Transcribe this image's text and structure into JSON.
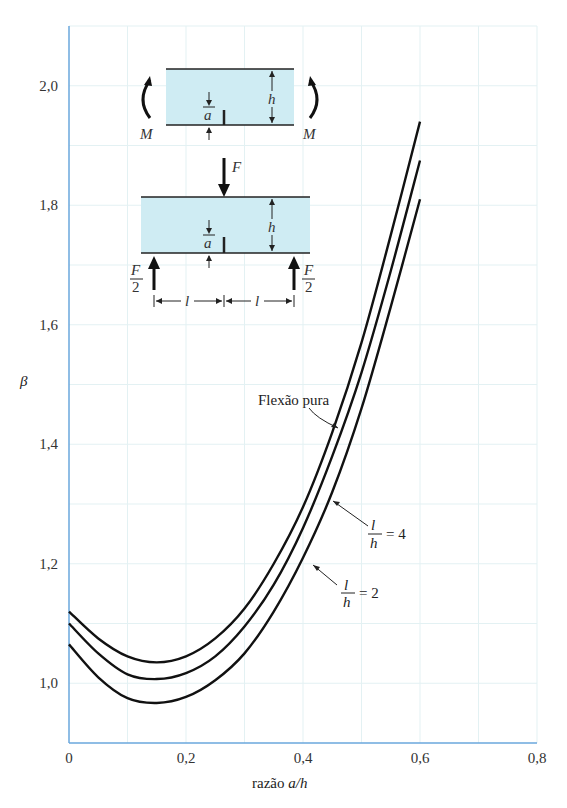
{
  "chart_data": {
    "type": "line",
    "title": "",
    "xlabel": "razão a/h",
    "ylabel": "β",
    "xlim": [
      0,
      0.8
    ],
    "ylim": [
      0.9,
      2.1
    ],
    "xticks": [
      "0",
      "0,2",
      "0,4",
      "0,6",
      "0,8"
    ],
    "yticks": [
      "1,0",
      "1,2",
      "1,4",
      "1,6",
      "1,8",
      "2,0"
    ],
    "grid": true,
    "x": [
      0,
      0.05,
      0.1,
      0.15,
      0.2,
      0.25,
      0.3,
      0.35,
      0.4,
      0.45,
      0.5,
      0.55,
      0.6
    ],
    "series": [
      {
        "name": "Flexão pura",
        "values": [
          1.12,
          1.075,
          1.045,
          1.035,
          1.045,
          1.075,
          1.125,
          1.2,
          1.295,
          1.42,
          1.57,
          1.75,
          1.94
        ]
      },
      {
        "name": "l/h = 4",
        "values": [
          1.1,
          1.05,
          1.015,
          1.007,
          1.017,
          1.045,
          1.095,
          1.165,
          1.26,
          1.38,
          1.52,
          1.69,
          1.875
        ]
      },
      {
        "name": "l/h = 2",
        "values": [
          1.065,
          1.01,
          0.975,
          0.967,
          0.977,
          1.005,
          1.05,
          1.12,
          1.21,
          1.32,
          1.46,
          1.63,
          1.81
        ]
      }
    ],
    "annotations": [
      "Flexão pura",
      "l/h = 4",
      "l/h = 2"
    ]
  },
  "labels": {
    "xlabel_prefix": "razão ",
    "xlabel_var": "a/h",
    "ylabel": "β",
    "flexao": "Flexão pura",
    "l": "l",
    "h": "h",
    "eq4": "= 4",
    "eq2": "= 2"
  },
  "inset": {
    "M": "M",
    "a": "a",
    "h": "h",
    "F": "F",
    "F2_num": "F",
    "F2_den": "2",
    "l": "l"
  }
}
